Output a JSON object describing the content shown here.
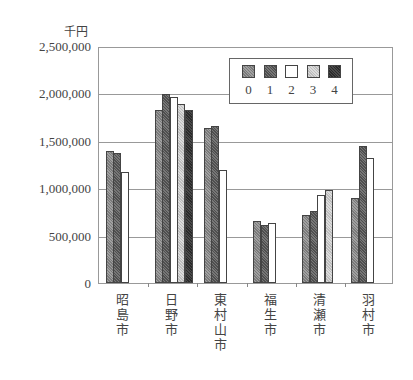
{
  "chart_data": {
    "type": "bar",
    "title": "",
    "unit_label": "千円",
    "xlabel": "",
    "ylabel": "千円",
    "ylim": [
      0,
      2500000
    ],
    "yticks": [
      {
        "value": 2500000,
        "label": "2,500,000"
      },
      {
        "value": 2000000,
        "label": "2,000,000"
      },
      {
        "value": 1500000,
        "label": "1,500,000"
      },
      {
        "value": 1000000,
        "label": "1,000,000"
      },
      {
        "value": 500000,
        "label": "500,000"
      },
      {
        "value": 0,
        "label": "0"
      }
    ],
    "grid": true,
    "legend_position": "top-right-inside",
    "categories": [
      "昭島市",
      "日野市",
      "東村山市",
      "福生市",
      "清瀬市",
      "羽村市"
    ],
    "series": [
      {
        "name": "0",
        "color": "#8c8c8c",
        "values": [
          1390000,
          1830000,
          1630000,
          650000,
          720000,
          900000
        ]
      },
      {
        "name": "1",
        "color": "#5f5f5f",
        "values": [
          1370000,
          1990000,
          1660000,
          610000,
          760000,
          1450000
        ]
      },
      {
        "name": "2",
        "color": "#ffffff",
        "values": [
          1170000,
          1960000,
          1190000,
          630000,
          930000,
          1320000
        ]
      },
      {
        "name": "3",
        "color": "#cccccc",
        "values": [
          null,
          1890000,
          null,
          null,
          980000,
          null
        ]
      },
      {
        "name": "4",
        "color": "#3a3a3a",
        "values": [
          null,
          1830000,
          null,
          null,
          null,
          null
        ]
      }
    ]
  }
}
